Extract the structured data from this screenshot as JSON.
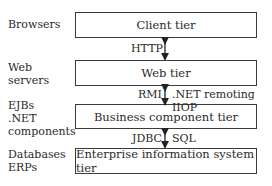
{
  "tiers": [
    {
      "name": "Client tier",
      "side_label": "Browsers"
    },
    {
      "name": "Web tier",
      "side_label": "Web\nservers"
    },
    {
      "name": "Business component tier",
      "side_label": "EJBs\n.NET\ncomponents"
    },
    {
      "name": "Enterprise information system tier",
      "side_label": "Databases\nERPs"
    }
  ],
  "connections": [
    {
      "from": "Client tier",
      "to": "Web tier",
      "left_label": "HTTP",
      "right_label": ""
    },
    {
      "from": "Web tier",
      "to": "Business component tier",
      "left_label": "RMI",
      "right_label": ".NET remoting IIOP"
    },
    {
      "from": "Business component tier",
      "to": "Enterprise information system tier",
      "left_label": "JDBC",
      "right_label": "SQL"
    }
  ]
}
